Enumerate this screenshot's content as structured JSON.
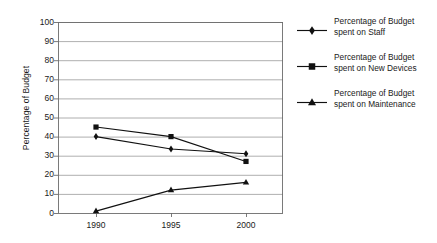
{
  "chart_data": {
    "type": "line",
    "title": "",
    "xlabel": "",
    "ylabel": "Percentage of Budget",
    "categories": [
      "1990",
      "1995",
      "2000"
    ],
    "x": [
      1990,
      1995,
      2000
    ],
    "xlim": [
      1988,
      2003
    ],
    "ylim": [
      0,
      100
    ],
    "ytick_step": 10,
    "yticks": [
      100,
      90,
      80,
      70,
      60,
      50,
      40,
      30,
      20,
      10,
      0
    ],
    "grid": "horizontal",
    "legend_position": "right",
    "series": [
      {
        "name": "Percentage of Budget spent on Staff",
        "name_line1": "Percentage of Budget",
        "name_line2": "spent on Staff",
        "marker": "diamond",
        "color": "#111111",
        "values": [
          40,
          33.5,
          31
        ]
      },
      {
        "name": "Percentage of Budget spent on New Devices",
        "name_line1": "Percentage of Budget",
        "name_line2": "spent on New Devices",
        "marker": "square",
        "color": "#111111",
        "values": [
          45,
          40,
          27
        ]
      },
      {
        "name": "Percentage of Budget spent on Maintenance",
        "name_line1": "Percentage of Budget",
        "name_line2": "spent on Maintenance",
        "marker": "triangle",
        "color": "#111111",
        "values": [
          1,
          12,
          16
        ]
      }
    ]
  },
  "axis": {
    "y_title": "Percentage of Budget",
    "y_labels": [
      "100",
      "90",
      "80",
      "70",
      "60",
      "50",
      "40",
      "30",
      "20",
      "10",
      "0"
    ],
    "x_labels": [
      "1990",
      "1995",
      "2000"
    ]
  },
  "legend": {
    "entries": [
      {
        "line1": "Percentage of Budget",
        "line2": "spent on Staff",
        "marker": "diamond"
      },
      {
        "line1": "Percentage of Budget",
        "line2": "spent on New Devices",
        "marker": "square"
      },
      {
        "line1": "Percentage of Budget",
        "line2": "spent on Maintenance",
        "marker": "triangle"
      }
    ]
  },
  "colors": {
    "series": "#111111",
    "grid": "#9a9a9a",
    "axis": "#6b6b6b",
    "text": "#1a1a1a",
    "background": "#ffffff"
  }
}
